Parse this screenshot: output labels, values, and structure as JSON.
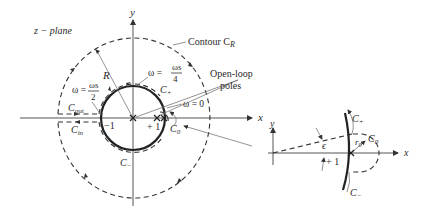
{
  "main_plot": {
    "plane_label": "z − plane",
    "x_axis_label": "x",
    "y_axis_label": "y",
    "contour_label": "Contour C",
    "contour_sub": "R",
    "radius_label": "R",
    "omega_quarter": {
      "lhs": "ω =",
      "num": "ωs",
      "den": "4"
    },
    "omega_half": {
      "lhs": "ω =",
      "num": "ωs",
      "den": "2"
    },
    "omega_zero": "ω = 0",
    "c_plus": "C+",
    "c_minus": "C−",
    "c_out": "Cout",
    "c_in": "Cin",
    "c_zero": "C0",
    "minus_one": "−1",
    "plus_one": "+ 1",
    "open_loop_poles_line1": "Open-loop",
    "open_loop_poles_line2": "poles"
  },
  "inset": {
    "x_axis_label": "x",
    "y_axis_label": "y",
    "c_plus": "C+",
    "c_minus": "C−",
    "c_zero": "C0",
    "r_zero": "r0",
    "epsilon": "ϵ",
    "plus_one": "+ 1"
  },
  "colors": {
    "ink": "#222222",
    "background": "#ffffff"
  }
}
